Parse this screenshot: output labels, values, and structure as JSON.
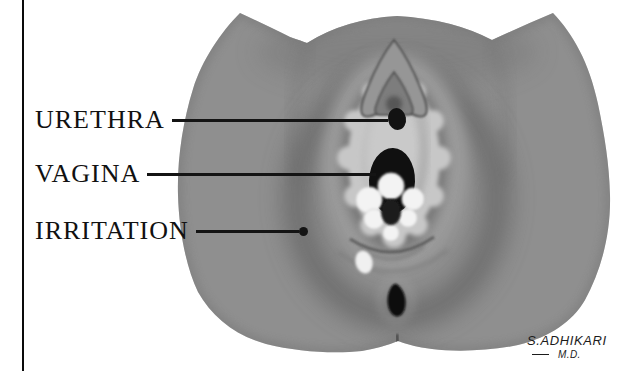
{
  "figure": {
    "kind": "hand-drawn grayscale anatomical diagram"
  },
  "labels": [
    {
      "text": "URETHRA"
    },
    {
      "text": "VAGINA"
    },
    {
      "text": "IRRITATION"
    }
  ],
  "signature": {
    "name": "S.ADHIKARI",
    "title": "M.D."
  },
  "colors": {
    "ink": "#141414",
    "background": "#ffffff",
    "skin": "#8f8f8f",
    "skin_light": "#9b9b9b",
    "irritation_ring": "#5f5f5f",
    "labia_edge_light": "#c7c7c7",
    "vestibule": "#bfbfbf",
    "opening_dark": "#121212",
    "mass_white": "#f3f3f3"
  }
}
